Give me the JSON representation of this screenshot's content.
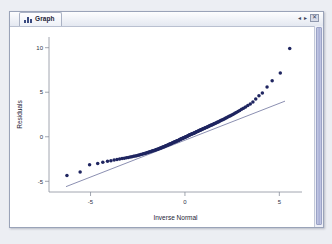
{
  "window": {
    "tab_label": "Graph",
    "tab_icon": "graph-icon",
    "controls": {
      "prev": "◂",
      "next": "▸",
      "close": "✕"
    }
  },
  "chart_data": {
    "type": "scatter",
    "title": "",
    "xlabel": "Inverse Normal",
    "ylabel": "Residuals",
    "xlim": [
      -7.2,
      6.2
    ],
    "ylim": [
      -6.2,
      11.2
    ],
    "xticks": [
      -5,
      0,
      5
    ],
    "xticklabels": [
      "-5",
      "0",
      "5"
    ],
    "yticks": [
      -5,
      0,
      5,
      10
    ],
    "yticklabels": [
      "-5",
      "0",
      "5",
      "10"
    ],
    "grid": false,
    "legend": false,
    "marker_color": "#1f2560",
    "refline_color": "#2b3270",
    "reference_line": {
      "x": [
        -6.3,
        5.3
      ],
      "y": [
        -5.6,
        4.0
      ]
    },
    "series": [
      {
        "name": "Residuals vs Inverse Normal",
        "x": [
          -6.25,
          -5.55,
          -5.05,
          -4.62,
          -4.35,
          -4.1,
          -3.92,
          -3.75,
          -3.6,
          -3.46,
          -3.33,
          -3.21,
          -3.1,
          -3.0,
          -2.9,
          -2.81,
          -2.72,
          -2.64,
          -2.56,
          -2.48,
          -2.41,
          -2.34,
          -2.27,
          -2.2,
          -2.14,
          -2.08,
          -2.02,
          -1.96,
          -1.9,
          -1.85,
          -1.79,
          -1.74,
          -1.69,
          -1.64,
          -1.59,
          -1.54,
          -1.5,
          -1.45,
          -1.41,
          -1.36,
          -1.32,
          -1.28,
          -1.24,
          -1.2,
          -1.16,
          -1.12,
          -1.08,
          -1.04,
          -1.0,
          -0.97,
          -0.93,
          -0.89,
          -0.86,
          -0.82,
          -0.79,
          -0.75,
          -0.72,
          -0.69,
          -0.65,
          -0.62,
          -0.59,
          -0.55,
          -0.52,
          -0.49,
          -0.46,
          -0.43,
          -0.4,
          -0.36,
          -0.33,
          -0.3,
          -0.27,
          -0.24,
          -0.21,
          -0.18,
          -0.15,
          -0.12,
          -0.09,
          -0.06,
          -0.03,
          0.0,
          0.03,
          0.06,
          0.09,
          0.12,
          0.15,
          0.18,
          0.21,
          0.24,
          0.27,
          0.3,
          0.33,
          0.36,
          0.4,
          0.43,
          0.46,
          0.49,
          0.52,
          0.55,
          0.59,
          0.62,
          0.65,
          0.69,
          0.72,
          0.75,
          0.79,
          0.82,
          0.86,
          0.89,
          0.93,
          0.97,
          1.0,
          1.04,
          1.08,
          1.12,
          1.16,
          1.2,
          1.24,
          1.28,
          1.32,
          1.36,
          1.41,
          1.45,
          1.5,
          1.54,
          1.59,
          1.64,
          1.69,
          1.74,
          1.79,
          1.85,
          1.9,
          1.96,
          2.02,
          2.08,
          2.14,
          2.2,
          2.27,
          2.34,
          2.41,
          2.48,
          2.56,
          2.64,
          2.72,
          2.81,
          2.9,
          3.0,
          3.1,
          3.21,
          3.33,
          3.46,
          3.6,
          3.75,
          3.92,
          4.1,
          4.35,
          4.62,
          5.05,
          5.55
        ],
        "y": [
          -4.35,
          -3.95,
          -3.15,
          -3.0,
          -2.85,
          -2.75,
          -2.68,
          -2.62,
          -2.56,
          -2.5,
          -2.45,
          -2.4,
          -2.36,
          -2.32,
          -2.28,
          -2.24,
          -2.2,
          -2.16,
          -2.12,
          -2.08,
          -2.04,
          -2.0,
          -1.96,
          -1.92,
          -1.88,
          -1.84,
          -1.8,
          -1.76,
          -1.72,
          -1.69,
          -1.65,
          -1.61,
          -1.57,
          -1.54,
          -1.5,
          -1.46,
          -1.43,
          -1.39,
          -1.36,
          -1.32,
          -1.29,
          -1.25,
          -1.22,
          -1.18,
          -1.15,
          -1.11,
          -1.08,
          -1.04,
          -1.01,
          -0.98,
          -0.94,
          -0.91,
          -0.88,
          -0.84,
          -0.81,
          -0.78,
          -0.75,
          -0.72,
          -0.68,
          -0.65,
          -0.62,
          -0.59,
          -0.56,
          -0.53,
          -0.5,
          -0.47,
          -0.44,
          -0.41,
          -0.38,
          -0.35,
          -0.32,
          -0.29,
          -0.26,
          -0.23,
          -0.2,
          -0.17,
          -0.14,
          -0.11,
          -0.08,
          -0.05,
          -0.02,
          0.01,
          0.04,
          0.07,
          0.1,
          0.13,
          0.16,
          0.19,
          0.22,
          0.25,
          0.28,
          0.31,
          0.34,
          0.37,
          0.4,
          0.43,
          0.46,
          0.49,
          0.53,
          0.56,
          0.59,
          0.62,
          0.66,
          0.69,
          0.72,
          0.76,
          0.79,
          0.83,
          0.86,
          0.9,
          0.93,
          0.97,
          1.01,
          1.04,
          1.08,
          1.12,
          1.16,
          1.2,
          1.24,
          1.28,
          1.32,
          1.36,
          1.41,
          1.45,
          1.5,
          1.55,
          1.6,
          1.65,
          1.7,
          1.76,
          1.82,
          1.88,
          1.94,
          2.0,
          2.07,
          2.14,
          2.21,
          2.29,
          2.37,
          2.45,
          2.54,
          2.63,
          2.73,
          2.84,
          2.95,
          3.08,
          3.2,
          3.34,
          3.5,
          3.68,
          3.9,
          4.25,
          4.6,
          4.9,
          5.6,
          6.3,
          7.15,
          9.9
        ]
      }
    ]
  }
}
